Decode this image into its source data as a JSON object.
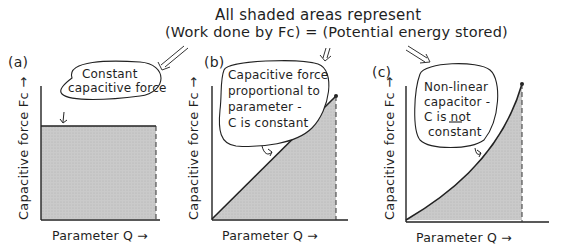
{
  "header": {
    "line1": "All shaded areas represent",
    "line2": "(Work done by Fᴄ) = (Potential energy stored)"
  },
  "panels": [
    {
      "id": "a",
      "label": "(a)",
      "ylabel": "Capacitive force Fᴄ →",
      "xlabel": "Parameter Q →",
      "bubble_lines": [
        "Constant",
        "capacitive force"
      ]
    },
    {
      "id": "b",
      "label": "(b)",
      "ylabel": "Capacitive force Fᴄ →",
      "xlabel": "Parameter Q →",
      "bubble_lines": [
        "Capacitive force",
        "proportional to",
        "parameter -",
        "C is constant"
      ]
    },
    {
      "id": "c",
      "label": "(c)",
      "ylabel": "Capacitive force Fᴄ →",
      "xlabel": "Parameter Q →",
      "bubble_lines": [
        "Non-linear",
        "capacitor -",
        "C is not",
        "constant"
      ],
      "underlined_word": "not"
    }
  ],
  "colors": {
    "ink": "#1f1f1f",
    "shade": "#c8c8c8"
  }
}
